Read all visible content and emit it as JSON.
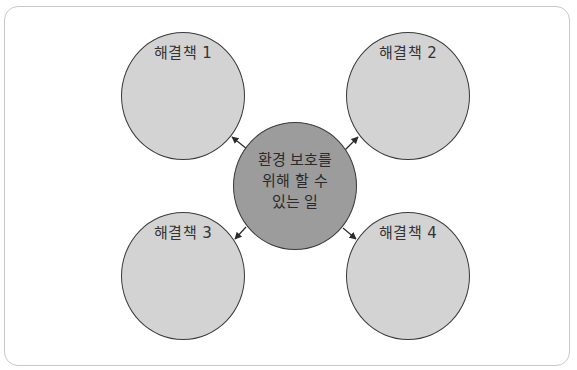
{
  "diagram": {
    "type": "mind-map",
    "center": {
      "label": "환경 보호를\n위해 할 수\n있는 일",
      "fill": "#9c9c9c"
    },
    "nodes": [
      {
        "id": 1,
        "label": "해결책 1",
        "position": "top-left"
      },
      {
        "id": 2,
        "label": "해결책 2",
        "position": "top-right"
      },
      {
        "id": 3,
        "label": "해결책 3",
        "position": "bottom-left"
      },
      {
        "id": 4,
        "label": "해결책 4",
        "position": "bottom-right"
      }
    ],
    "node_fill": "#d3d3d3",
    "stroke": "#3a3a3a",
    "frame_border": "#c8c8c8"
  }
}
